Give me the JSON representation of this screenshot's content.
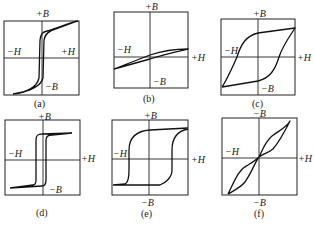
{
  "figure": {
    "panels": [
      {
        "id": "a",
        "caption": "(a)",
        "top_label": "+B",
        "bottom_label": "−B",
        "left_label": "−H",
        "right_label": "+H",
        "shape": "narrow steep rectangular loop"
      },
      {
        "id": "b",
        "caption": "(b)",
        "top_label": "+B",
        "bottom_label": "−B",
        "left_label": "−H",
        "right_label": "+H",
        "shape": "thin slanted low-permeability loop"
      },
      {
        "id": "c",
        "caption": "(c)",
        "top_label": "+B",
        "bottom_label": "−B",
        "left_label": "−H",
        "right_label": "+H",
        "shape": "wide loop with high coercivity"
      },
      {
        "id": "d",
        "caption": "(d)",
        "top_label": "+B",
        "bottom_label": "−B",
        "left_label": "−H",
        "right_label": "+H",
        "shape": "square loop"
      },
      {
        "id": "e",
        "caption": "(e)",
        "top_label": "+B",
        "bottom_label": "−B",
        "left_label": "−H",
        "right_label": "+H",
        "shape": "wide square loop"
      },
      {
        "id": "f",
        "caption": "(f)",
        "top_label": "−B",
        "bottom_label": "−B",
        "left_label": "−H",
        "right_label": "+H",
        "shape": "constricted (wasp-waisted) loop"
      }
    ]
  }
}
